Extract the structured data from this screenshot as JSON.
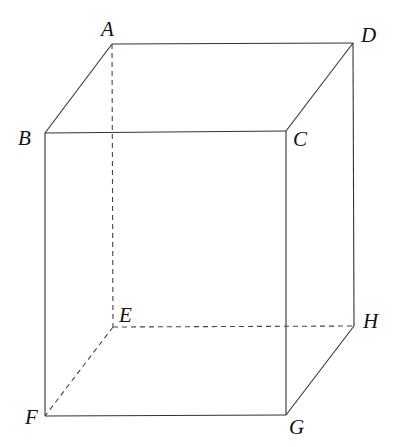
{
  "diagram": {
    "type": "cube-perspective",
    "vertices": {
      "A": {
        "label": "A",
        "x": 112,
        "y": 44
      },
      "B": {
        "label": "B",
        "x": 45,
        "y": 133
      },
      "C": {
        "label": "C",
        "x": 286,
        "y": 131
      },
      "D": {
        "label": "D",
        "x": 353,
        "y": 43
      },
      "E": {
        "label": "E",
        "x": 113,
        "y": 327
      },
      "F": {
        "label": "F",
        "x": 45,
        "y": 416
      },
      "G": {
        "label": "G",
        "x": 286,
        "y": 415
      },
      "H": {
        "label": "H",
        "x": 354,
        "y": 326
      }
    },
    "solid_edges": [
      "AB",
      "AD",
      "BC",
      "CD",
      "BF",
      "CG",
      "DH",
      "FG",
      "GH"
    ],
    "dashed_edges": [
      "AE",
      "EF",
      "EH"
    ],
    "line_color": "#333333"
  }
}
